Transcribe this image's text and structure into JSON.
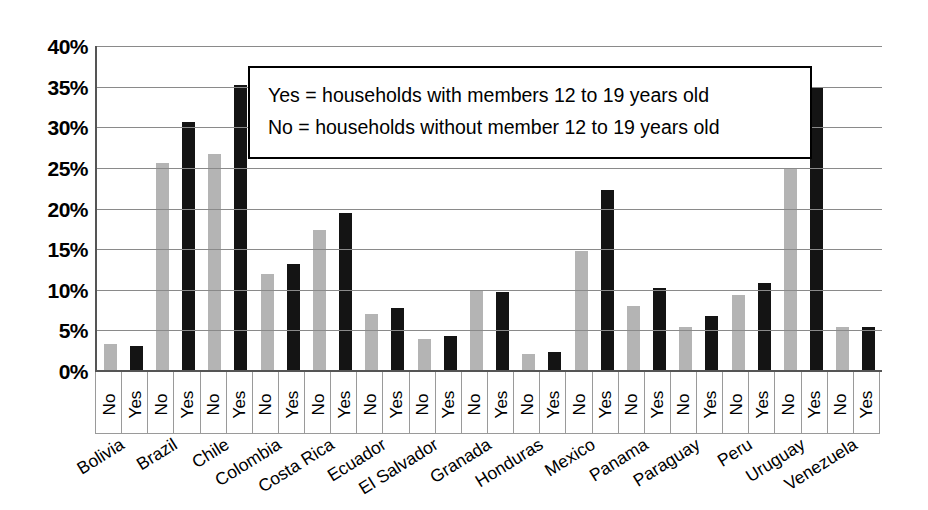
{
  "chart_data": {
    "type": "bar",
    "title": "",
    "subtitle": "",
    "xlabel": "",
    "ylabel": "",
    "ylim": [
      0,
      40
    ],
    "y_tick_labels": [
      "40%",
      "35%",
      "30%",
      "25%",
      "20%",
      "15%",
      "10%",
      "5%",
      "0%"
    ],
    "y_tick_values": [
      40,
      35,
      30,
      25,
      20,
      15,
      10,
      5,
      0
    ],
    "grid": true,
    "legend_position": "inside-top-center",
    "categories": [
      "Bolivia",
      "Brazil",
      "Chile",
      "Colombia",
      "Costa Rica",
      "Ecuador",
      "El Salvador",
      "Granada",
      "Honduras",
      "Mexico",
      "Panama",
      "Paraguay",
      "Peru",
      "Uruguay",
      "Venezuela"
    ],
    "subcategory_labels": [
      "No",
      "Yes"
    ],
    "series": [
      {
        "name": "No",
        "color": "#b4b4b4",
        "values": [
          3.3,
          25.6,
          26.7,
          12.0,
          17.3,
          7.0,
          4.0,
          9.8,
          2.1,
          14.8,
          8.0,
          5.4,
          9.3,
          24.9,
          5.4
        ]
      },
      {
        "name": "Yes",
        "color": "#141414",
        "values": [
          3.1,
          30.6,
          35.2,
          13.2,
          19.5,
          7.7,
          4.3,
          9.7,
          2.3,
          22.3,
          10.2,
          6.8,
          10.8,
          35.0,
          5.4
        ]
      }
    ],
    "annotations": [
      "Yes = households with members 12 to 19 years old",
      "No = households without member 12 to 19 years old"
    ]
  },
  "legend": {
    "line1": "Yes = households with members 12 to 19 years old",
    "line2": "No = households without member 12 to 19 years old"
  }
}
